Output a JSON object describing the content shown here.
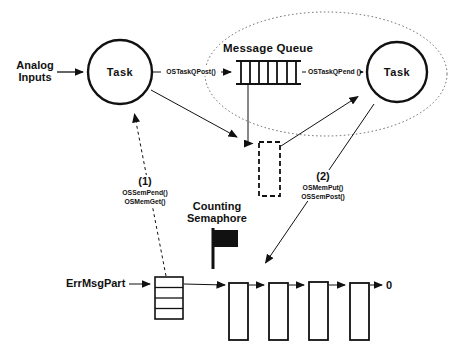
{
  "colors": {
    "background": "#ffffff",
    "ink": "#111111"
  },
  "nodes": {
    "analog_inputs": {
      "line1": "Analog",
      "line2": "Inputs"
    },
    "task_left": {
      "label": "Task"
    },
    "task_right": {
      "label": "Task"
    },
    "message_queue": {
      "title": "Message Queue",
      "divider_count": 7
    },
    "memory_partition": {
      "name": "ErrMsgPart",
      "row_count": 4
    },
    "free_list": {
      "block_count": 4,
      "terminator": "0"
    },
    "counting_semaphore": {
      "line1": "Counting",
      "line2": "Semaphore"
    }
  },
  "edges": {
    "post": {
      "label": "OSTaskQPost()"
    },
    "pend": {
      "label": "OSTaskQPend ()"
    },
    "step1": {
      "number": "(1)",
      "call_a": "OSSemPend()",
      "call_b": "OSMemGet()"
    },
    "step2": {
      "number": "(2)",
      "call_a": "OSMemPut()",
      "call_b": "OSSemPost()"
    }
  },
  "icons": {
    "counting_semaphore": "flag-icon",
    "message_queue": "queue-comb-icon",
    "memory_block": "dashed-rect-icon"
  }
}
